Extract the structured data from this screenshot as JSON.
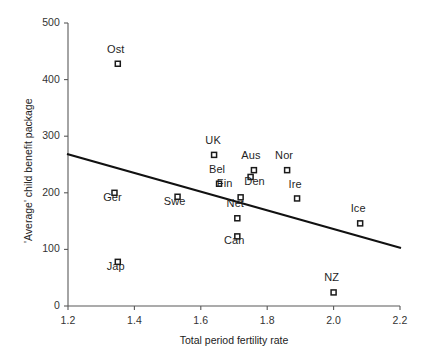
{
  "chart_data": {
    "type": "scatter",
    "title": "",
    "xlabel": "Total period fertility rate",
    "ylabel": "'Average' child benefit package",
    "xlim": [
      1.2,
      2.2
    ],
    "ylim": [
      0,
      500
    ],
    "xticks": [
      "1.2",
      "1.4",
      "1.6",
      "1.8",
      "2.0",
      "2.2"
    ],
    "xtick_values": [
      1.2,
      1.4,
      1.6,
      1.8,
      2.0,
      2.2
    ],
    "yticks": [
      "0",
      "100",
      "200",
      "300",
      "400",
      "500"
    ],
    "ytick_values": [
      0,
      100,
      200,
      300,
      400,
      500
    ],
    "grid": false,
    "legend": "none",
    "marker": "open-square",
    "points": [
      {
        "label": "Ost",
        "x": 1.35,
        "y": 428,
        "label_dx": -2,
        "label_dy": -15
      },
      {
        "label": "Ger",
        "x": 1.34,
        "y": 200,
        "label_dx": -2,
        "label_dy": 4
      },
      {
        "label": "Jap",
        "x": 1.35,
        "y": 78,
        "label_dx": -2,
        "label_dy": 4
      },
      {
        "label": "Swe",
        "x": 1.53,
        "y": 193,
        "label_dx": -3,
        "label_dy": 4
      },
      {
        "label": "UK",
        "x": 1.64,
        "y": 267,
        "label_dx": -1,
        "label_dy": -15
      },
      {
        "label": "Bel",
        "x": 1.655,
        "y": 216,
        "label_dx": -2,
        "label_dy": -15
      },
      {
        "label": "Fin",
        "x": 1.72,
        "y": 192,
        "label_dx": -16,
        "label_dy": -14
      },
      {
        "label": "Net",
        "x": 1.71,
        "y": 155,
        "label_dx": -2,
        "label_dy": -15
      },
      {
        "label": "Can",
        "x": 1.71,
        "y": 123,
        "label_dx": -3,
        "label_dy": 4
      },
      {
        "label": "Aus",
        "x": 1.76,
        "y": 240,
        "label_dx": -3,
        "label_dy": -15
      },
      {
        "label": "Den",
        "x": 1.75,
        "y": 228,
        "label_dx": 4,
        "label_dy": 4
      },
      {
        "label": "Nor",
        "x": 1.86,
        "y": 240,
        "label_dx": -3,
        "label_dy": -15
      },
      {
        "label": "Ire",
        "x": 1.89,
        "y": 190,
        "label_dx": -2,
        "label_dy": -14
      },
      {
        "label": "Ice",
        "x": 2.08,
        "y": 146,
        "label_dx": -2,
        "label_dy": -15
      },
      {
        "label": "NZ",
        "x": 2.0,
        "y": 24,
        "label_dx": -2,
        "label_dy": -15
      }
    ],
    "trend_line": {
      "x_start": 1.2,
      "y_start": 268,
      "x_end": 2.2,
      "y_end": 103
    },
    "colors": {
      "axis": "#595959",
      "marker_stroke": "#1a1a1a",
      "trend": "#111111",
      "text": "#1f1f1f",
      "background": "#ffffff"
    }
  }
}
